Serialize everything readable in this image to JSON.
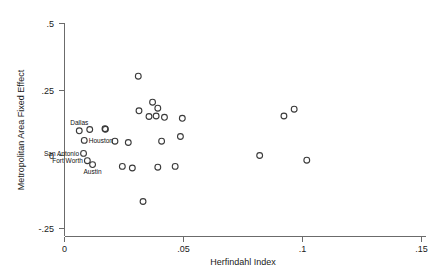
{
  "chart_data": {
    "type": "scatter",
    "title": "",
    "xlabel": "Herfindahl Index",
    "ylabel": "Metropolitan Area Fixed Effect",
    "xlim": [
      0,
      0.155
    ],
    "ylim": [
      -0.275,
      0.52
    ],
    "xticks": [
      0,
      0.05,
      0.1,
      0.15
    ],
    "xticklabels": [
      "0",
      ".05",
      ".1",
      ".15"
    ],
    "yticks": [
      -0.25,
      0,
      0.25,
      0.5
    ],
    "yticklabels": [
      "-.25",
      "0",
      ".25",
      ".5"
    ],
    "grid": false,
    "legend": false,
    "marker": "open-circle",
    "points": [
      {
        "x": 0.0062,
        "y": 0.095,
        "label": "Dallas",
        "label_pos": "above"
      },
      {
        "x": 0.0106,
        "y": 0.1,
        "label": "",
        "label_pos": ""
      },
      {
        "x": 0.017,
        "y": 0.103,
        "label": "",
        "label_pos": ""
      },
      {
        "x": 0.0172,
        "y": 0.101,
        "label": "",
        "label_pos": ""
      },
      {
        "x": 0.0083,
        "y": 0.058,
        "label": "Houston",
        "label_pos": "right"
      },
      {
        "x": 0.008,
        "y": 0.008,
        "label": "San Antonio",
        "label_pos": "left"
      },
      {
        "x": 0.0096,
        "y": -0.02,
        "label": "Fort Worth",
        "label_pos": "left"
      },
      {
        "x": 0.0118,
        "y": -0.035,
        "label": "Austin",
        "label_pos": "below"
      },
      {
        "x": 0.0212,
        "y": 0.055,
        "label": "",
        "label_pos": ""
      },
      {
        "x": 0.0243,
        "y": -0.042,
        "label": "",
        "label_pos": ""
      },
      {
        "x": 0.0268,
        "y": 0.05,
        "label": "",
        "label_pos": ""
      },
      {
        "x": 0.031,
        "y": 0.305,
        "label": "",
        "label_pos": ""
      },
      {
        "x": 0.0285,
        "y": -0.048,
        "label": "",
        "label_pos": ""
      },
      {
        "x": 0.033,
        "y": -0.177,
        "label": "",
        "label_pos": ""
      },
      {
        "x": 0.0313,
        "y": 0.172,
        "label": "",
        "label_pos": ""
      },
      {
        "x": 0.037,
        "y": 0.205,
        "label": "",
        "label_pos": ""
      },
      {
        "x": 0.0355,
        "y": 0.15,
        "label": "",
        "label_pos": ""
      },
      {
        "x": 0.0385,
        "y": 0.152,
        "label": "",
        "label_pos": ""
      },
      {
        "x": 0.0392,
        "y": 0.182,
        "label": "",
        "label_pos": ""
      },
      {
        "x": 0.042,
        "y": 0.147,
        "label": "",
        "label_pos": ""
      },
      {
        "x": 0.0408,
        "y": 0.055,
        "label": "",
        "label_pos": ""
      },
      {
        "x": 0.0392,
        "y": -0.045,
        "label": "",
        "label_pos": ""
      },
      {
        "x": 0.0465,
        "y": -0.042,
        "label": "",
        "label_pos": ""
      },
      {
        "x": 0.0487,
        "y": 0.073,
        "label": "",
        "label_pos": ""
      },
      {
        "x": 0.0495,
        "y": 0.143,
        "label": "",
        "label_pos": ""
      },
      {
        "x": 0.0922,
        "y": 0.152,
        "label": "",
        "label_pos": ""
      },
      {
        "x": 0.0965,
        "y": 0.178,
        "label": "",
        "label_pos": ""
      },
      {
        "x": 0.082,
        "y": 0.0,
        "label": "",
        "label_pos": ""
      },
      {
        "x": 0.1018,
        "y": -0.018,
        "label": "",
        "label_pos": ""
      }
    ]
  },
  "colors": {
    "marker_stroke": "#3a3a3a",
    "axis": "#6b6b6b",
    "text": "#1a1a1a",
    "background": "#ffffff"
  }
}
